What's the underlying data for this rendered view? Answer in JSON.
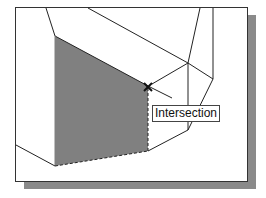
{
  "tooltip": {
    "label": "Intersection"
  },
  "colors": {
    "face_fill": "#808080",
    "shadow": "#8a8a8a",
    "line": "#222222"
  },
  "marker": {
    "type": "intersection-snap-x"
  }
}
